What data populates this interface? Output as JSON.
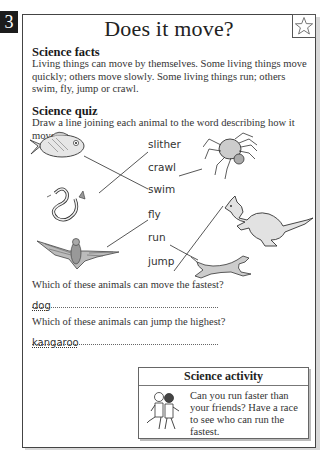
{
  "page_number": "3",
  "title": "Does it move?",
  "facts": {
    "heading": "Science facts",
    "text": "Living things can move by themselves. Some living things move quickly; others move slowly. Some living things run; others swim, fly, jump or crawl."
  },
  "quiz": {
    "heading": "Science quiz",
    "instruction": "Draw a line joining each animal to the word describing how it moves.",
    "words": [
      "slither",
      "crawl",
      "swim",
      "fly",
      "run",
      "jump"
    ],
    "animals": [
      "fish",
      "snake",
      "bat",
      "spider",
      "kangaroo",
      "dog"
    ],
    "matches": [
      {
        "animal": "fish",
        "word": "swim"
      },
      {
        "animal": "snake",
        "word": "slither"
      },
      {
        "animal": "bat",
        "word": "fly"
      },
      {
        "animal": "spider",
        "word": "crawl"
      },
      {
        "animal": "kangaroo",
        "word": "jump"
      },
      {
        "animal": "dog",
        "word": "run"
      }
    ]
  },
  "questions": [
    {
      "text": "Which of these animals can move the fastest?",
      "answer": "dog"
    },
    {
      "text": "Which of these animals can jump the highest?",
      "answer": "kangaroo"
    }
  ],
  "activity": {
    "heading": "Science activity",
    "text": "Can you run faster than your friends? Have a race to see who can run the fastest."
  }
}
